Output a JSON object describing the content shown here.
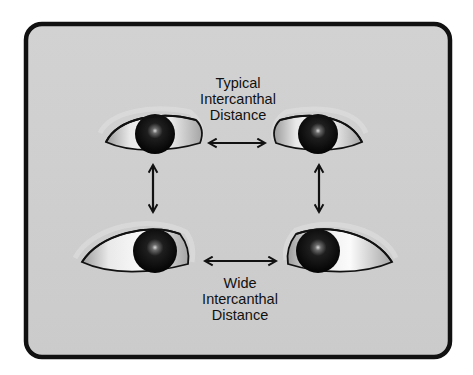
{
  "diagram": {
    "top_caption": [
      "Typical",
      "Intercanthal",
      "Distance"
    ],
    "bottom_caption": [
      "Wide",
      "Intercanthal",
      "Distance"
    ],
    "eyes": [
      {
        "id": "top-left",
        "gaze": "forward"
      },
      {
        "id": "top-right",
        "gaze": "forward"
      },
      {
        "id": "bottom-left",
        "gaze": "right"
      },
      {
        "id": "bottom-right",
        "gaze": "left"
      }
    ],
    "arrows": [
      {
        "id": "typical-distance",
        "direction": "horizontal",
        "type": "double-headed"
      },
      {
        "id": "wide-distance",
        "direction": "horizontal",
        "type": "double-headed"
      },
      {
        "id": "left-vertical",
        "direction": "vertical",
        "type": "double-headed"
      },
      {
        "id": "right-vertical",
        "direction": "vertical",
        "type": "double-headed"
      }
    ],
    "colors": {
      "background": "#cfcfcf",
      "frame": "#111111",
      "eye_outline": "#111111",
      "sclera": "#f2f2f2",
      "iris": "#0a0a0a"
    }
  }
}
